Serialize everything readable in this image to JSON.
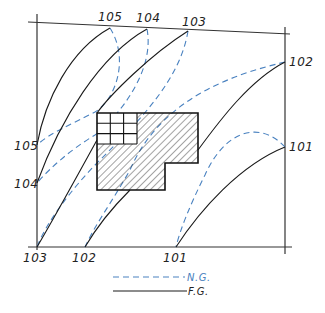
{
  "diagram": {
    "type": "grading-plan",
    "colors": {
      "natural_grade": "#4a82c0",
      "finished_grade": "#1a1a1a",
      "frame": "#333333"
    },
    "contour_labels": {
      "top": [
        "105",
        "104",
        "103"
      ],
      "right": [
        "102",
        "101"
      ],
      "left": [
        "105",
        "104"
      ],
      "bottom": [
        "103",
        "102",
        "101"
      ]
    },
    "building": {
      "fill": "hatched",
      "grid_cells": "3x3"
    }
  },
  "legend": {
    "natural_grade_label": "N.G.",
    "finished_grade_label": "F.G."
  }
}
